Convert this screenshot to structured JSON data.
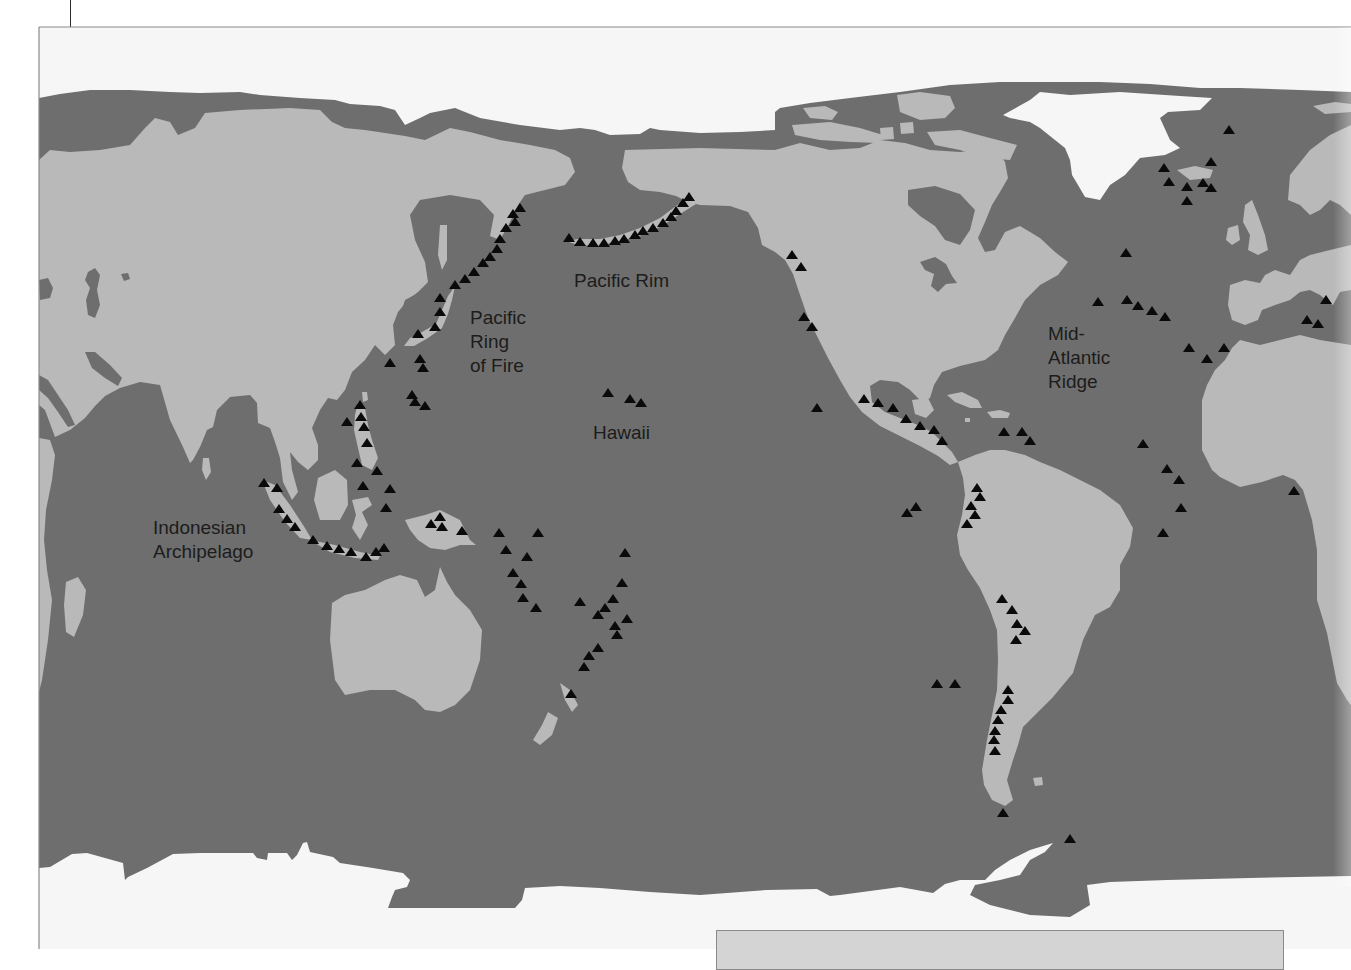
{
  "map": {
    "colors": {
      "ocean": "#6e6e6e",
      "land": "#b9b9b9",
      "ice": "#f6f6f6",
      "volcano": "#0a0a0a",
      "label": "#1c1c1c",
      "frame": "#8a8a8a"
    },
    "labels": {
      "pacific_rim": {
        "lines": [
          "Pacific Rim"
        ]
      },
      "ring_of_fire": {
        "lines": [
          "Pacific",
          "Ring",
          "of Fire"
        ]
      },
      "hawaii": {
        "lines": [
          "Hawaii"
        ]
      },
      "indonesian_archipelago": {
        "lines": [
          "Indonesian",
          "Archipelago"
        ]
      },
      "mid_atlantic_ridge": {
        "lines": [
          "Mid-",
          "Atlantic",
          "Ridge"
        ]
      }
    },
    "legend_marker": "volcano-triangle",
    "shapes": {
      "ice": [
        "39,27 1351,27 1351,92 1300,90 1240,88 1200,88 1150,84 1100,82 1050,82 1000,82 950,85 900,92 850,98 810,103 780,108 775,112 775,130 740,132 700,133 660,130 650,128 640,134 610,135 595,130 580,128 560,130 520,125 480,118 455,108 430,113 420,118 405,125 395,110 380,106 350,104 335,100 300,98 260,95 240,92 200,93 170,92 130,90 90,90 60,94 39,98",
        "1003,115 1030,100 1040,92 1070,95 1120,92 1180,96 1212,98 1200,110 1168,112 1160,118 1170,140 1180,148 1165,155 1140,158 1125,175 1110,185 1100,200 1085,197 1078,185 1072,175 1070,160 1065,148 1055,140 1040,128 1030,122 1010,118",
        "39,868 50,867 72,854 87,853 123,863 125,880 128,877 147,868 173,854 200,853 253,853 257,858 267,860 268,853 287,853 292,860 297,855 303,843 307,842 310,852 333,857 340,863 373,868 403,873 410,880 407,887 395,890 392,897 388,908 515,908 522,900 525,888 560,886 600,888 650,892 700,895 767,890 817,889 830,896 840,895 900,887 933,893 945,884 960,880 985,880 995,870 1010,860 1030,850 1053,843 1045,852 1030,860 1020,875 1000,880 975,885 970,895 990,905 1030,915 1070,917 1090,905 1087,885 1110,882 1167,880 1250,878 1351,876 1351,949 39,949"
      ],
      "land": [
        "39,160 50,150 70,152 100,150 130,145 145,128 155,118 170,122 178,135 195,128 205,113 240,110 290,108 320,110 332,122 345,128 365,130 385,133 405,136 425,140 450,128 470,132 500,140 530,145 555,150 570,158 575,172 565,185 545,190 525,195 518,205 510,222 500,240 490,236 494,215 480,200 450,195 420,200 410,215 415,240 425,262 428,282 418,292 408,300 398,312 393,325 395,345 385,355 375,345 365,360 352,372 345,390 337,400 328,398 320,410 312,428 318,445 318,460 308,470 298,462 290,452 292,470 298,492 292,500 283,482 280,458 275,442 270,428 258,423 257,403 250,395 230,397 217,410 213,427 207,430 200,447 193,460 190,463 183,447 170,420 160,385 140,382 120,388 105,396 95,406 85,418 70,430 55,437 45,410 39,405",
        "39,438 50,440 55,455 52,480 46,510 44,540 47,570 52,600 48,640 42,680 39,692",
        "66,582 78,577 86,590 83,615 74,637 66,632 64,605",
        "203,458 209,458 211,472 206,480 202,470",
        "440,225 447,225 447,260 442,270 438,255",
        "455,286 448,296 442,310 436,324 422,332 410,338 404,346 414,346 428,338 442,328 448,314 452,300",
        "362,392 367,392 368,400 363,402",
        "358,402 365,408 368,425 372,440 378,458 372,470 362,465 358,448 354,430 355,415",
        "262,480 275,485 290,505 305,528 312,540 300,538 285,522 270,500",
        "310,540 335,545 360,552 380,556 378,560 355,558 330,552",
        "318,478 335,470 347,480 348,505 340,520 320,520 314,500",
        "352,500 368,497 372,505 362,512 368,525 360,540 352,528 356,515",
        "405,520 425,515 440,510 460,520 470,540 476,545 460,545 445,550 430,548 418,540 410,530",
        "332,603 345,595 365,590 385,580 400,575 417,580 425,597 435,590 440,567 447,582 455,595 470,610 482,630 480,660 470,690 455,705 440,712 425,710 415,700 395,690 370,690 345,695 335,680 330,640",
        "560,683 570,690 578,705 572,712 565,700",
        "548,712 558,718 552,735 540,745 533,740 542,725",
        "625,150 700,148 775,150 800,143 830,150 860,148 880,140 905,143 930,150 960,152 995,148 1005,162 1008,178 1000,192 992,205 985,222 978,238 985,252 995,250 1005,232 1020,226 1040,238 1055,252 1068,262 1058,275 1040,285 1025,300 1015,318 1005,335 998,350 985,360 960,366 942,372 934,385 930,398 922,402 910,390 898,382 880,380 870,386 872,402 885,412 900,418 918,425 932,432 942,442 952,452 958,462 950,465 938,456 920,446 900,436 880,426 862,412 850,397 840,380 828,358 818,338 808,318 800,295 793,274 785,260 775,252 762,245 758,228 748,212 730,206 700,205 688,202 676,196 660,192 640,190 628,182 622,168",
        "690,198 696,204 680,214 662,226 642,235 620,241 598,246 578,245 566,241 578,239 600,239 620,235 640,228 660,218 676,206",
        "792,125 830,122 860,128 883,135 880,143 850,142 820,140 795,135",
        "803,108 825,106 838,112 832,120 810,118",
        "897,95 920,92 950,96 955,108 945,118 920,120 900,112",
        "927,132 960,130 990,138 1017,145 1010,160 985,158 960,150 935,145",
        "880,128 893,127 894,139 881,140",
        "900,123 913,122 914,133 901,134",
        "947,395 962,392 978,400 982,408 970,408 955,402",
        "987,412 1000,410 1010,413 1008,418 992,418",
        "965,418 970,418 970,422 965,422",
        "912,400 928,398 934,410 926,418 915,414",
        "958,462 975,455 990,450 1005,450 1025,455 1040,462 1060,470 1080,480 1100,490 1120,505 1133,528 1130,547 1120,565 1120,590 1110,607 1095,615 1083,640 1073,673 1053,697 1040,710 1023,727 1018,745 1013,760 1007,780 1013,800 1005,806 992,800 984,785 982,770 987,740 992,715 997,690 998,660 997,630 990,610 980,588 968,570 960,555 957,535 962,515 965,495 963,478",
        "1033,778 1042,777 1043,785 1035,786",
        "1351,345 1320,340 1300,335 1280,340 1260,345 1240,340 1232,348 1225,360 1215,370 1207,385 1202,400 1202,450 1212,470 1220,477 1240,487 1262,482 1283,475 1295,480 1303,490 1312,520 1317,550 1317,600 1327,633 1337,683 1347,700 1351,705",
        "1230,285 1245,280 1260,283 1265,275 1275,270 1290,275 1300,260 1310,255 1330,250 1351,245 1351,290 1340,292 1333,305 1326,300 1320,295 1310,290 1300,292 1290,300 1275,305 1262,310 1258,320 1245,325 1232,320 1228,305",
        "1290,175 1310,150 1330,135 1351,125 1351,215 1340,205 1330,200 1320,210 1310,215 1300,205 1288,200",
        "1245,205 1252,200 1258,215 1265,235 1268,250 1258,255 1248,250 1250,235 1243,222",
        "1228,228 1238,225 1240,240 1232,245 1226,240",
        "1177,170 1195,166 1213,170 1210,178 1190,180",
        "1313,106 1335,102 1351,104 1351,112 1325,114"
      ],
      "water": [
        "88,272 95,268 100,275 97,290 100,305 95,318 88,315 86,300 90,288 85,280",
        "39,280 48,278 53,288 50,298 40,300",
        "121,274 128,273 130,279 124,281",
        "39,375 48,380 58,395 68,410 75,425 68,427 58,412 48,398 39,390",
        "85,352 95,352 110,365 122,378 118,386 105,378 92,368",
        "405,300 420,292 432,300 428,318 412,330 398,322",
        "920,262 935,257 946,264 952,276 957,283 946,284 938,292 931,286 934,274 925,270",
        "908,190 935,186 960,194 975,210 970,230 960,245 945,240 935,226 920,216 908,205"
      ]
    },
    "volcanoes": [
      [
        520,
        208
      ],
      [
        513,
        214
      ],
      [
        515,
        222
      ],
      [
        506,
        228
      ],
      [
        500,
        239
      ],
      [
        497,
        249
      ],
      [
        490,
        257
      ],
      [
        483,
        263
      ],
      [
        474,
        272
      ],
      [
        465,
        279
      ],
      [
        455,
        285
      ],
      [
        440,
        298
      ],
      [
        440,
        312
      ],
      [
        435,
        327
      ],
      [
        418,
        334
      ],
      [
        390,
        363
      ],
      [
        420,
        359
      ],
      [
        423,
        368
      ],
      [
        412,
        395
      ],
      [
        415,
        402
      ],
      [
        425,
        406
      ],
      [
        360,
        405
      ],
      [
        361,
        417
      ],
      [
        347,
        422
      ],
      [
        364,
        427
      ],
      [
        367,
        443
      ],
      [
        357,
        463
      ],
      [
        377,
        471
      ],
      [
        363,
        486
      ],
      [
        390,
        489
      ],
      [
        386,
        508
      ],
      [
        440,
        517
      ],
      [
        431,
        524
      ],
      [
        442,
        527
      ],
      [
        462,
        531
      ],
      [
        264,
        483
      ],
      [
        277,
        488
      ],
      [
        279,
        509
      ],
      [
        287,
        519
      ],
      [
        295,
        527
      ],
      [
        313,
        540
      ],
      [
        327,
        546
      ],
      [
        339,
        549
      ],
      [
        351,
        552
      ],
      [
        366,
        557
      ],
      [
        376,
        552
      ],
      [
        384,
        548
      ],
      [
        499,
        533
      ],
      [
        538,
        533
      ],
      [
        506,
        550
      ],
      [
        527,
        557
      ],
      [
        513,
        573
      ],
      [
        521,
        584
      ],
      [
        523,
        598
      ],
      [
        536,
        608
      ],
      [
        580,
        602
      ],
      [
        625,
        553
      ],
      [
        622,
        583
      ],
      [
        613,
        599
      ],
      [
        605,
        608
      ],
      [
        598,
        615
      ],
      [
        627,
        619
      ],
      [
        615,
        626
      ],
      [
        617,
        635
      ],
      [
        598,
        648
      ],
      [
        589,
        656
      ],
      [
        584,
        667
      ],
      [
        571,
        694
      ],
      [
        569,
        238
      ],
      [
        580,
        242
      ],
      [
        593,
        243
      ],
      [
        604,
        243
      ],
      [
        615,
        241
      ],
      [
        624,
        239
      ],
      [
        635,
        235
      ],
      [
        643,
        231
      ],
      [
        653,
        228
      ],
      [
        663,
        223
      ],
      [
        671,
        217
      ],
      [
        676,
        211
      ],
      [
        683,
        203
      ],
      [
        689,
        197
      ],
      [
        608,
        393
      ],
      [
        630,
        399
      ],
      [
        641,
        403
      ],
      [
        792,
        255
      ],
      [
        801,
        267
      ],
      [
        804,
        317
      ],
      [
        812,
        327
      ],
      [
        817,
        408
      ],
      [
        864,
        399
      ],
      [
        878,
        403
      ],
      [
        893,
        408
      ],
      [
        906,
        419
      ],
      [
        920,
        426
      ],
      [
        934,
        430
      ],
      [
        942,
        441
      ],
      [
        1004,
        432
      ],
      [
        1022,
        432
      ],
      [
        1030,
        441
      ],
      [
        977,
        488
      ],
      [
        980,
        497
      ],
      [
        971,
        506
      ],
      [
        975,
        515
      ],
      [
        967,
        524
      ],
      [
        907,
        513
      ],
      [
        916,
        507
      ],
      [
        1002,
        599
      ],
      [
        1012,
        610
      ],
      [
        1017,
        624
      ],
      [
        1025,
        631
      ],
      [
        1016,
        640
      ],
      [
        937,
        684
      ],
      [
        955,
        684
      ],
      [
        1008,
        690
      ],
      [
        1008,
        700
      ],
      [
        1001,
        710
      ],
      [
        998,
        720
      ],
      [
        995,
        731
      ],
      [
        994,
        740
      ],
      [
        995,
        751
      ],
      [
        1003,
        813
      ],
      [
        1070,
        839
      ],
      [
        1229,
        130
      ],
      [
        1211,
        162
      ],
      [
        1164,
        168
      ],
      [
        1169,
        182
      ],
      [
        1187,
        187
      ],
      [
        1203,
        183
      ],
      [
        1211,
        188
      ],
      [
        1187,
        201
      ],
      [
        1126,
        253
      ],
      [
        1098,
        302
      ],
      [
        1127,
        300
      ],
      [
        1138,
        306
      ],
      [
        1152,
        311
      ],
      [
        1165,
        317
      ],
      [
        1189,
        348
      ],
      [
        1207,
        359
      ],
      [
        1224,
        348
      ],
      [
        1326,
        300
      ],
      [
        1307,
        320
      ],
      [
        1318,
        324
      ],
      [
        1143,
        444
      ],
      [
        1167,
        469
      ],
      [
        1179,
        480
      ],
      [
        1181,
        508
      ],
      [
        1163,
        533
      ],
      [
        1294,
        491
      ]
    ]
  }
}
